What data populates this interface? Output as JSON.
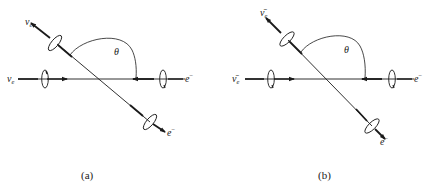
{
  "figure": {
    "panels": [
      {
        "id": "a",
        "caption": "(a)",
        "incoming_left": {
          "symbol": "ν",
          "subscript": "e"
        },
        "incoming_right": {
          "symbol": "e",
          "superscript": "−"
        },
        "outgoing_upper_left": {
          "symbol": "ν",
          "subscript": "e"
        },
        "outgoing_lower_right": {
          "symbol": "e",
          "superscript": "−"
        },
        "angle_label": "θ"
      },
      {
        "id": "b",
        "caption": "(b)",
        "incoming_left": {
          "symbol": "ν̄",
          "subscript": "e"
        },
        "incoming_right": {
          "symbol": "e",
          "superscript": "−"
        },
        "outgoing_upper_left": {
          "symbol": "ν̄",
          "subscript": "e"
        },
        "outgoing_lower_right": {
          "symbol": "e",
          "superscript": "−"
        },
        "angle_label": "θ"
      }
    ],
    "colors": {
      "ink": "#1a1a1a",
      "background": "#ffffff"
    }
  }
}
